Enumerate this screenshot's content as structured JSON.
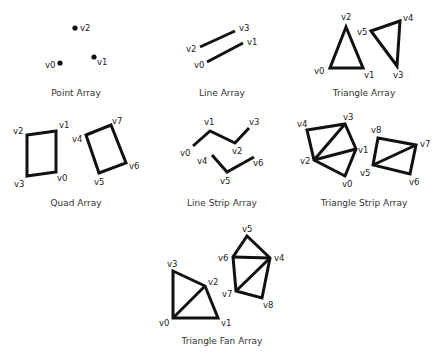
{
  "colors": {
    "stroke": "#111111",
    "text": "#333333",
    "background": "#ffffff"
  },
  "panels": {
    "point": {
      "title": "Point Array",
      "labels": {
        "v0": "v0",
        "v1": "v1",
        "v2": "v2"
      }
    },
    "line": {
      "title": "Line Array",
      "labels": {
        "v0": "v0",
        "v1": "v1",
        "v2": "v2",
        "v3": "v3"
      }
    },
    "triangle": {
      "title": "Triangle Array",
      "labels": {
        "v0": "v0",
        "v1": "v1",
        "v2": "v2",
        "v3": "v3",
        "v4": "v4",
        "v5": "v5"
      }
    },
    "quad": {
      "title": "Quad Array",
      "labels": {
        "v0": "v0",
        "v1": "v1",
        "v2": "v2",
        "v3": "v3",
        "v4": "v4",
        "v5": "v5",
        "v6": "v6",
        "v7": "v7"
      }
    },
    "line_strip": {
      "title": "Line Strip Array",
      "labels": {
        "v0": "v0",
        "v1": "v1",
        "v2": "v2",
        "v3": "v3",
        "v4": "v4",
        "v5": "v5",
        "v6": "v6"
      }
    },
    "triangle_strip": {
      "title": "Triangle Strip Array",
      "labels": {
        "v0": "v0",
        "v1": "v1",
        "v2": "v2",
        "v3": "v3",
        "v4": "v4",
        "v5": "v5",
        "v6": "v6",
        "v7": "v7",
        "v8": "v8"
      }
    },
    "triangle_fan": {
      "title": "Triangle Fan Array",
      "labels": {
        "v0": "v0",
        "v1": "v1",
        "v2": "v2",
        "v3": "v3",
        "v4": "v4",
        "v5": "v5",
        "v6": "v6",
        "v7": "v7",
        "v8": "v8"
      }
    }
  }
}
